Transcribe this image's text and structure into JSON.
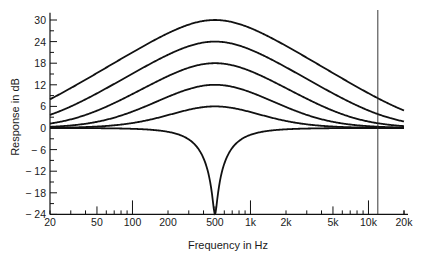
{
  "chart_data": {
    "type": "line",
    "title": "",
    "xlabel": "Frequency in Hz",
    "ylabel": "Response in dB",
    "xscale": "log",
    "xlim": [
      20,
      20000
    ],
    "ylim": [
      -24,
      32
    ],
    "grid": false,
    "legend": null,
    "x_tick_labels": [
      "20",
      "50",
      "100",
      "200",
      "500",
      "1k",
      "2k",
      "5k",
      "10k",
      "20k"
    ],
    "x_tick_values": [
      20,
      50,
      100,
      200,
      500,
      1000,
      2000,
      5000,
      10000,
      20000
    ],
    "y_tick_labels": [
      "30",
      "24",
      "18",
      "12",
      "6",
      "0",
      "-6",
      "-12",
      "-18",
      "-24"
    ],
    "y_tick_values": [
      30,
      24,
      18,
      12,
      6,
      0,
      -6,
      -12,
      -18,
      -24
    ],
    "center_frequency_hz": 500,
    "series": [
      {
        "name": "boost +30 dB",
        "peak_db": 30,
        "x": [
          20,
          50,
          100,
          200,
          500,
          1000,
          2000,
          5000,
          10000,
          20000
        ],
        "values": [
          4,
          6.5,
          10,
          16,
          30,
          20,
          13,
          7.5,
          5,
          3.3
        ]
      },
      {
        "name": "boost +24 dB",
        "peak_db": 24,
        "x": [
          20,
          50,
          100,
          200,
          500,
          1000,
          2000,
          5000,
          10000,
          20000
        ],
        "values": [
          2.2,
          4,
          6.5,
          11,
          24,
          15,
          9,
          4.5,
          3,
          1.8
        ]
      },
      {
        "name": "boost +18 dB",
        "peak_db": 18,
        "x": [
          20,
          50,
          100,
          200,
          500,
          1000,
          2000,
          5000,
          10000,
          20000
        ],
        "values": [
          1.2,
          2.2,
          3.8,
          7,
          18,
          10,
          5.5,
          2.6,
          1.6,
          1
        ]
      },
      {
        "name": "boost +12 dB",
        "peak_db": 12,
        "x": [
          20,
          50,
          100,
          200,
          500,
          1000,
          2000,
          5000,
          10000,
          20000
        ],
        "values": [
          0.6,
          1,
          1.8,
          3.6,
          12,
          5.5,
          2.7,
          1.2,
          0.8,
          0.5
        ]
      },
      {
        "name": "boost +6 dB",
        "peak_db": 6,
        "x": [
          20,
          50,
          100,
          200,
          500,
          1000,
          2000,
          5000,
          10000,
          20000
        ],
        "values": [
          0.2,
          0.4,
          0.7,
          1.4,
          6,
          2.2,
          1,
          0.5,
          0.3,
          0.2
        ]
      },
      {
        "name": "notch",
        "peak_db": -24,
        "x": [
          20,
          50,
          100,
          200,
          400,
          480,
          500,
          520,
          600,
          1000,
          2000,
          5000,
          20000
        ],
        "values": [
          0,
          0,
          -0.05,
          -0.3,
          -4,
          -14,
          -24,
          -14,
          -3,
          -0.4,
          -0.1,
          0,
          0
        ]
      }
    ],
    "annotations": [
      {
        "type": "vertical_line",
        "x_hz": 12000,
        "description": "vertical marker line near 12 kHz"
      }
    ]
  }
}
